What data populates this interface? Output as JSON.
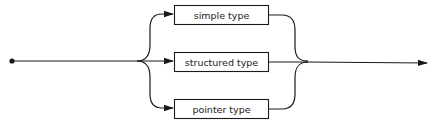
{
  "diagram": {
    "type": "syntax-diagram",
    "colors": {
      "stroke": "#1a1a1a",
      "background": "#ffffff",
      "text": "#222222"
    },
    "alternatives": [
      {
        "id": "simple",
        "label": "simple type"
      },
      {
        "id": "structured",
        "label": "structured type"
      },
      {
        "id": "pointer",
        "label": "pointer type"
      }
    ],
    "start": "entry-dot",
    "end": "exit-arrow"
  }
}
